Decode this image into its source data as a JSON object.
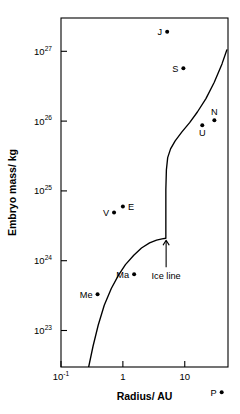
{
  "chart_data": {
    "type": "scatter",
    "title": "",
    "xlabel": "Radius/ AU",
    "ylabel": "Embryo mass/ kg",
    "xscale": "log",
    "yscale": "log",
    "xlim": [
      0.1,
      50
    ],
    "ylim": [
      3e+22,
      3e+27
    ],
    "grid": false,
    "legend": "none",
    "xticks": [
      {
        "value": 0.1,
        "label_base": "10",
        "label_exp": "-1"
      },
      {
        "value": 1,
        "label_base": "1",
        "label_exp": ""
      },
      {
        "value": 10,
        "label_base": "10",
        "label_exp": ""
      }
    ],
    "yticks": [
      {
        "value": 1e+23,
        "label_base": "10",
        "label_exp": "23"
      },
      {
        "value": 1e+24,
        "label_base": "10",
        "label_exp": "24"
      },
      {
        "value": 1e+25,
        "label_base": "10",
        "label_exp": "25"
      },
      {
        "value": 1e+26,
        "label_base": "10",
        "label_exp": "26"
      },
      {
        "value": 1e+27,
        "label_base": "10",
        "label_exp": "27"
      }
    ],
    "points": [
      {
        "name": "Me",
        "label": "Me",
        "x": 0.39,
        "y": 3.3e+23,
        "label_side": "left"
      },
      {
        "name": "V",
        "label": "V",
        "x": 0.72,
        "y": 4.9e+24,
        "label_side": "left"
      },
      {
        "name": "E",
        "label": "E",
        "x": 1.0,
        "y": 6e+24,
        "label_side": "right"
      },
      {
        "name": "Ma",
        "label": "Ma",
        "x": 1.52,
        "y": 6.4e+23,
        "label_side": "left"
      },
      {
        "name": "J",
        "label": "J",
        "x": 5.2,
        "y": 1.9e+27,
        "label_side": "left"
      },
      {
        "name": "S",
        "label": "S",
        "x": 9.5,
        "y": 5.7e+26,
        "label_side": "left"
      },
      {
        "name": "U",
        "label": "U",
        "x": 19.2,
        "y": 8.7e+25,
        "label_side": "below"
      },
      {
        "name": "N",
        "label": "N",
        "x": 30.1,
        "y": 1.03e+26,
        "label_side": "above"
      },
      {
        "name": "P",
        "label": "P",
        "x": 39.5,
        "y": 1.3e+22,
        "label_side": "left"
      }
    ],
    "annotations": [
      {
        "name": "ice-line",
        "text": "Ice line",
        "x": 5.0,
        "y": 6e+23,
        "arrow_to_y": 2e+24
      }
    ],
    "curve": {
      "name": "embryo-isolation-mass-curve",
      "description": "Isolation mass curve with a discontinuous jump at the ice line",
      "points": [
        [
          0.28,
          3e+22
        ],
        [
          0.33,
          6e+22
        ],
        [
          0.4,
          1.2e+23
        ],
        [
          0.5,
          2.3e+23
        ],
        [
          0.65,
          4e+23
        ],
        [
          0.85,
          6.2e+23
        ],
        [
          1.1,
          8.8e+23
        ],
        [
          1.5,
          1.2e+24
        ],
        [
          2.0,
          1.52e+24
        ],
        [
          2.7,
          1.8e+24
        ],
        [
          3.5,
          1.97e+24
        ],
        [
          4.3,
          2.06e+24
        ],
        [
          4.95,
          2.1e+24
        ],
        [
          4.95,
          1.05e+25
        ],
        [
          5.05,
          2e+25
        ],
        [
          5.3,
          3e+25
        ],
        [
          5.9,
          4e+25
        ],
        [
          7.0,
          5.2e+25
        ],
        [
          9.0,
          7e+25
        ],
        [
          12.0,
          9.5e+25
        ],
        [
          16.0,
          1.35e+26
        ],
        [
          22.0,
          2.1e+26
        ],
        [
          30.0,
          3.6e+26
        ],
        [
          40.0,
          6.6e+26
        ],
        [
          48.0,
          1.05e+27
        ]
      ]
    }
  }
}
